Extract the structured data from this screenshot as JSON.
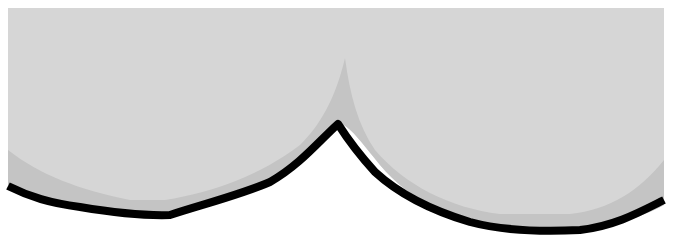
{
  "figure": {
    "colors": {
      "background": "#ffffff",
      "region_fill": "#d6d6d6",
      "band_fill": "#c4c4c4",
      "outline": "#000000"
    },
    "labels": []
  }
}
